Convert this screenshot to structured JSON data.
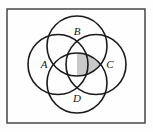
{
  "figure": {
    "background_color": "#fefefe",
    "frame": {
      "name": "outer-rectangle-border",
      "x": 7,
      "y": 9,
      "width": 138,
      "height": 114,
      "stroke_color": "#3a3a3a",
      "stroke_width": 1.4,
      "fill": "none"
    },
    "stroke_color": "#1a1a1a",
    "stroke_width": 1.6,
    "shade_color": "#c9c9c9",
    "labels": [
      {
        "id": "A",
        "text": "A",
        "x": 44,
        "y": 68,
        "position": "left"
      },
      {
        "id": "B",
        "text": "B",
        "x": 77,
        "y": 35,
        "position": "top"
      },
      {
        "id": "C",
        "text": "C",
        "x": 110,
        "y": 68,
        "position": "right"
      },
      {
        "id": "D",
        "text": "D",
        "x": 77,
        "y": 102,
        "position": "bottom"
      }
    ],
    "circles": [
      {
        "id": "A",
        "label": "A",
        "cx": 58,
        "cy": 64.5,
        "r": 30,
        "position": "left"
      },
      {
        "id": "B",
        "label": "B",
        "cx": 77,
        "cy": 46,
        "r": 30,
        "position": "top"
      },
      {
        "id": "C",
        "label": "C",
        "cx": 96,
        "cy": 64.5,
        "r": 30,
        "position": "right"
      },
      {
        "id": "D",
        "label": "D",
        "cx": 77,
        "cy": 83,
        "r": 30,
        "position": "bottom"
      }
    ],
    "shaded_region": {
      "name": "shaded-intersection",
      "description": "small gray lens right of the central quadruple-intersection square",
      "fill": "#c9c9c9"
    },
    "center_region": {
      "name": "central-intersection-square",
      "cx": 77,
      "cy": 64.5,
      "description": "square-ish region where all four circles overlap"
    }
  }
}
